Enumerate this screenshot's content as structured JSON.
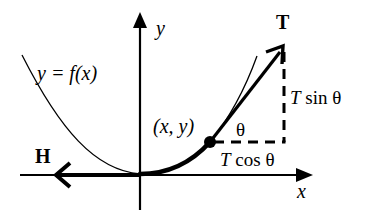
{
  "diagram": {
    "type": "physics-force-diagram",
    "labels": {
      "y_axis": "y",
      "x_axis": "x",
      "curve": "y = f(x)",
      "point": "(x, y)",
      "tension_vector": "T",
      "horizontal_force": "H",
      "angle": "θ",
      "vertical_component": "T sin θ",
      "horizontal_component": "T cos θ"
    },
    "colors": {
      "stroke": "#000000",
      "background": "#ffffff"
    }
  }
}
